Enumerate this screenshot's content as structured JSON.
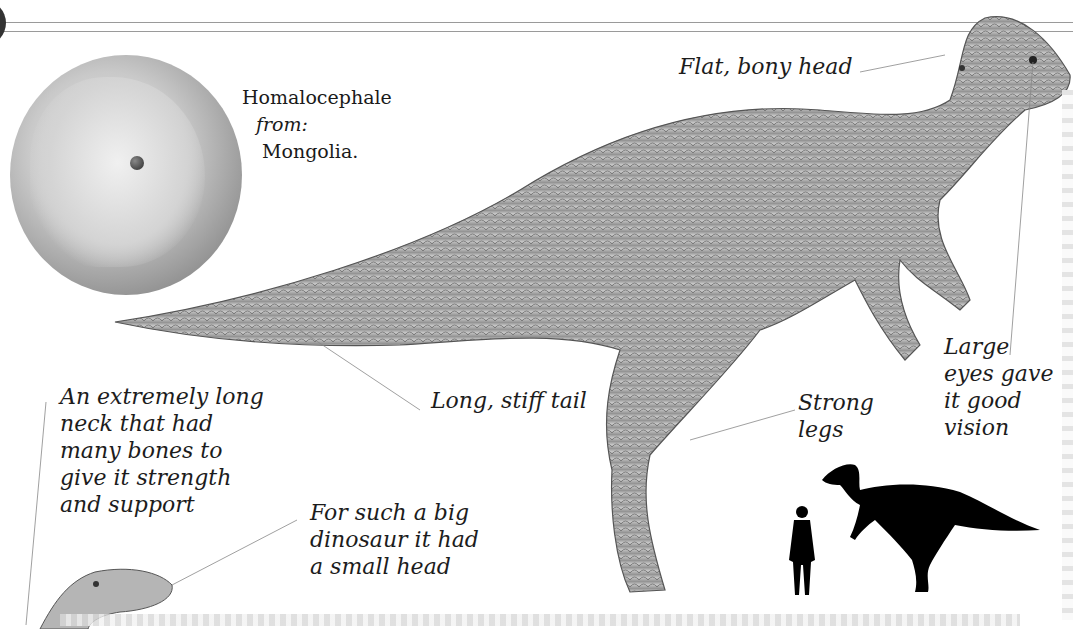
{
  "page": {
    "title": "Homalocephale",
    "from_label": "from:",
    "origin": "Mongolia",
    "origin_suffix": "."
  },
  "labels": {
    "head": "Flat, bony head",
    "tail": "Long, stiff tail",
    "legs": "Strong\nlegs",
    "eyes": "Large\neyes gave\nit good\nvision",
    "neck": "An extremely long\nneck that had\nmany bones to\ngive it strength\nand support",
    "small_head": "For such a big\ndinosaur it had\na small head"
  },
  "illustrations": {
    "globe": "globe-asia-icon",
    "dinosaur": "homalocephale-illustration",
    "scale_human": "human-silhouette-icon",
    "scale_dinosaur": "dinosaur-silhouette-icon",
    "sauropod_head": "sauropod-head-illustration"
  },
  "colors": {
    "text": "#1c1c1c",
    "rule": "#9a9a9a",
    "silhouette": "#000000",
    "illustration_gray": "#a8a8a8"
  }
}
